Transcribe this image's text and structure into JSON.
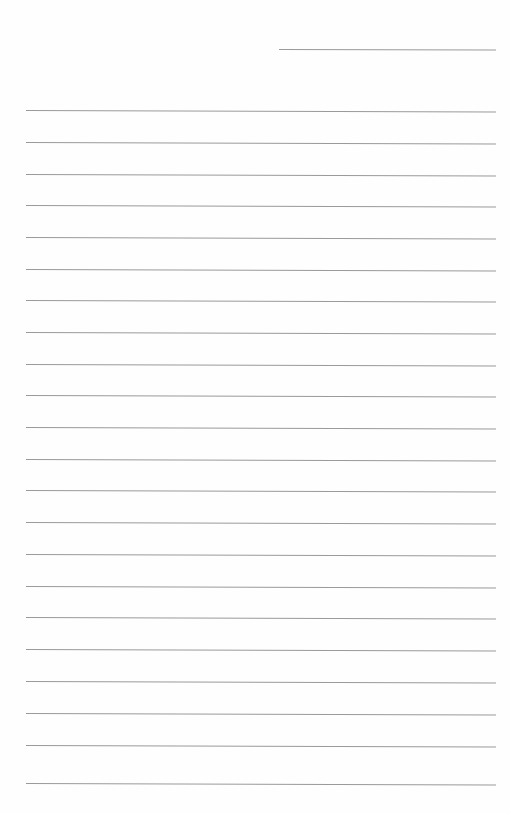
{
  "document": {
    "type": "blank-lined-page",
    "paper_color": "#fefefe",
    "rule_color": "#9a9a9a",
    "header_rule": {
      "x": 279,
      "y": 49,
      "width": 217
    },
    "body_rules": {
      "x": 26,
      "width": 470,
      "y_positions": [
        110,
        142,
        174,
        205,
        237,
        269,
        300,
        332,
        364,
        395,
        427,
        459,
        490,
        522,
        554,
        586,
        617,
        649,
        681,
        713,
        745,
        783
      ]
    },
    "text_lines": []
  }
}
